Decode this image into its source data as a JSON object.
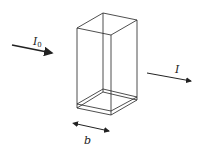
{
  "diagram": {
    "labels": {
      "incident": "I",
      "incident_sub": "0",
      "transmitted": "I",
      "path_length": "b"
    },
    "colors": {
      "stroke": "#222222",
      "background": "#ffffff"
    }
  }
}
